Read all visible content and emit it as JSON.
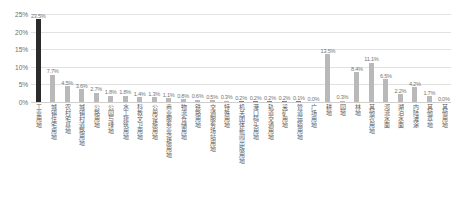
{
  "chart_data": {
    "type": "bar",
    "title": "",
    "xlabel": "",
    "ylabel": "",
    "ylim": [
      0,
      25
    ],
    "grid": true,
    "legend": "none",
    "y_ticks": [
      "0%",
      "5%",
      "10%",
      "15%",
      "20%",
      "25%"
    ],
    "y_tick_values": [
      0,
      5,
      10,
      15,
      20,
      25
    ],
    "categories": [
      "工业用地",
      "城镇住宅用地",
      "农村宅基地",
      "城镇村道路用地",
      "公路用地",
      "公园与绿地",
      "水工建筑用地",
      "科教文卫用地",
      "公用设施用地",
      "商业服务业设施用地",
      "物流仓储用地",
      "铁路用地",
      "交通服务场站用地",
      "特殊用地",
      "机关团体新闻出版用地",
      "港口码头用地",
      "轨道交通用地",
      "采矿用地",
      "管道运输用地",
      "广场用地",
      "耕地",
      "园地",
      "林地",
      "其他农用地",
      "河流水面",
      "湖泊水面",
      "内陆滩涂",
      "其他草地",
      "其他用地"
    ],
    "values": [
      23.5,
      7.7,
      4.5,
      3.6,
      2.7,
      1.8,
      1.8,
      1.4,
      1.3,
      1.1,
      0.8,
      0.6,
      0.5,
      0.3,
      0.2,
      0.2,
      0.2,
      0.2,
      0.1,
      0.0,
      13.5,
      0.3,
      8.4,
      11.1,
      6.5,
      2.2,
      4.2,
      1.7,
      0.0
    ],
    "value_labels": [
      "23.5%",
      "7.7%",
      "4.5%",
      "3.6%",
      "2.7%",
      "1.8%",
      "1.8%",
      "1.4%",
      "1.3%",
      "1.1%",
      "0.8%",
      "0.6%",
      "0.5%",
      "0.3%",
      "0.2%",
      "0.2%",
      "0.2%",
      "0.2%",
      "0.1%",
      "0.0%",
      "13.5%",
      "0.3%",
      "8.4%",
      "11.1%",
      "6.5%",
      "2.2%",
      "4.2%",
      "1.7%",
      "0.0%"
    ],
    "colors": {
      "bar_default": "#b9b9b9",
      "bar_highlight": "#2b2b2b",
      "bar_mid": "#7d7d7d",
      "grid": "#e2e2e2",
      "axis_text": "#6d6d6d",
      "label_text": "#5c5c5c"
    }
  }
}
